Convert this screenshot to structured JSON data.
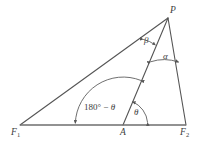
{
  "figure": {
    "type": "geometry-diagram",
    "background_color": "#ffffff",
    "line_color": "#555555",
    "baseline_color": "#6e6e6e",
    "text_color": "#3c3c3c",
    "vertices": [
      {
        "id": "P",
        "label": "P",
        "x": 168,
        "y": 18
      },
      {
        "id": "F1",
        "label": "F",
        "sub": "1",
        "x": 20,
        "y": 125
      },
      {
        "id": "A",
        "label": "A",
        "x": 123,
        "y": 125
      },
      {
        "id": "F2",
        "label": "F",
        "sub": "2",
        "x": 186,
        "y": 125
      }
    ],
    "segments": [
      {
        "id": "F1-P",
        "from": "F1",
        "to": "P"
      },
      {
        "id": "F1-F2",
        "from": "F1",
        "to": "F2"
      },
      {
        "id": "P-F2",
        "from": "P",
        "to": "F2"
      },
      {
        "id": "A-P",
        "from": "A",
        "to": "P"
      }
    ],
    "angles": [
      {
        "id": "alpha",
        "label": "α",
        "at": "P",
        "between": [
          "A-P",
          "P-F2"
        ],
        "arc_radius": 44,
        "arrowheads": "both"
      },
      {
        "id": "beta",
        "label": "β",
        "at": "P",
        "between": [
          "F1-P",
          "A-P"
        ],
        "arc_radius": 30,
        "arrowheads": "both"
      },
      {
        "id": "theta",
        "label": "θ",
        "at": "A",
        "between": [
          "A-F2",
          "A-P"
        ],
        "arc_radius": 25,
        "arrowheads": "both"
      },
      {
        "id": "supplementary",
        "label_prefix": "180° − ",
        "label_symbol": "θ",
        "at": "A",
        "between": [
          "A-P",
          "A-F1"
        ],
        "arc_radius": 48,
        "arrowheads": "both"
      }
    ]
  }
}
